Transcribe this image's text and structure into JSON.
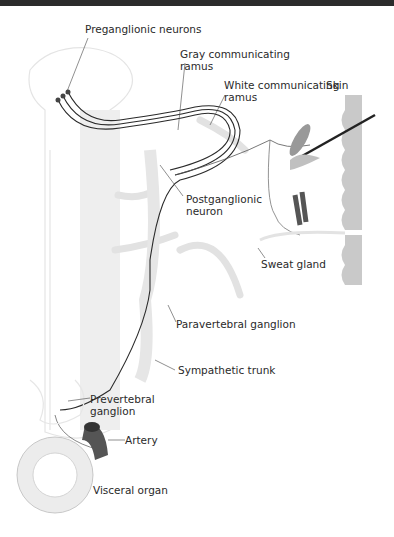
{
  "figure": {
    "labels": {
      "preganglionic": "Preganglionic neurons",
      "gray_ramus_1": "Gray communicating",
      "gray_ramus_2": "ramus",
      "white_ramus_1": "White communicating",
      "white_ramus_2": "ramus",
      "skin": "Skin",
      "postganglionic_1": "Postganglionic",
      "postganglionic_2": "neuron",
      "sweat_gland": "Sweat gland",
      "paravertebral": "Paravertebral ganglion",
      "sympathetic_trunk": "Sympathetic trunk",
      "prevertebral_1": "Prevertebral",
      "prevertebral_2": "ganglion",
      "artery": "Artery",
      "visceral_organ": "Visceral organ"
    },
    "colors": {
      "nerve": "#2a2a2a",
      "faint_structure": "#e2e2e2",
      "skin": "#c9c9c9",
      "artery": "#555555",
      "top_band": "#2b2b2b"
    }
  }
}
